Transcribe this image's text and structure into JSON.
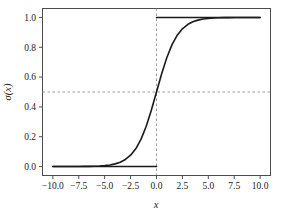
{
  "chart_data": {
    "type": "line",
    "title": "",
    "subtitle": "",
    "xlabel": "x",
    "ylabel": "σ(x)",
    "xlim": [
      -11.0,
      11.0
    ],
    "ylim": [
      -0.06,
      1.06
    ],
    "grid": false,
    "legend": null,
    "x_ticks": [
      -10.0,
      -7.5,
      -5.0,
      -2.5,
      0.0,
      2.5,
      5.0,
      7.5,
      10.0
    ],
    "x_tick_labels": [
      "−10.0",
      "−7.5",
      "−5.0",
      "−2.5",
      "0.0",
      "2.5",
      "5.0",
      "7.5",
      "10.0"
    ],
    "y_ticks": [
      0.0,
      0.2,
      0.4,
      0.6,
      0.8,
      1.0
    ],
    "y_tick_labels": [
      "0.0",
      "0.2",
      "0.4",
      "0.6",
      "0.8",
      "1.0"
    ],
    "series": [
      {
        "name": "sigmoid",
        "type": "line",
        "color": "#1a1a1a",
        "linewidth": 1.6,
        "x": [
          -10.0,
          -9.5,
          -9.0,
          -8.5,
          -8.0,
          -7.5,
          -7.0,
          -6.5,
          -6.0,
          -5.5,
          -5.0,
          -4.5,
          -4.0,
          -3.5,
          -3.0,
          -2.5,
          -2.0,
          -1.5,
          -1.0,
          -0.5,
          0.0,
          0.5,
          1.0,
          1.5,
          2.0,
          2.5,
          3.0,
          3.5,
          4.0,
          4.5,
          5.0,
          5.5,
          6.0,
          6.5,
          7.0,
          7.5,
          8.0,
          8.5,
          9.0,
          9.5,
          10.0
        ],
        "y": [
          4.54e-05,
          7.49e-05,
          0.0001234,
          0.0002035,
          0.0003354,
          0.0005527,
          0.0009111,
          0.0015012,
          0.0024726,
          0.0040702,
          0.0066929,
          0.0109869,
          0.0179862,
          0.0293122,
          0.0474259,
          0.0758582,
          0.1192029,
          0.1824255,
          0.2689414,
          0.3775407,
          0.5,
          0.6224593,
          0.7310586,
          0.8175745,
          0.8807971,
          0.9241418,
          0.9525741,
          0.9706878,
          0.9820138,
          0.9890131,
          0.9933071,
          0.9959298,
          0.9975274,
          0.9984988,
          0.9990889,
          0.9994473,
          0.9996646,
          0.9997965,
          0.9998766,
          0.9999251,
          0.9999546
        ]
      },
      {
        "name": "lower-asymptote",
        "type": "segment",
        "color": "#1a1a1a",
        "linewidth": 1.6,
        "x": [
          -10.0,
          0.0
        ],
        "y": [
          0.0,
          0.0
        ]
      },
      {
        "name": "upper-asymptote",
        "type": "segment",
        "color": "#1a1a1a",
        "linewidth": 1.6,
        "x": [
          0.0,
          10.0
        ],
        "y": [
          1.0,
          1.0
        ]
      }
    ],
    "reference_lines": [
      {
        "name": "vertical-threshold",
        "orientation": "vertical",
        "value": 0.0,
        "style": "dashed",
        "color": "#9a9a9a"
      },
      {
        "name": "horizontal-threshold",
        "orientation": "horizontal",
        "value": 0.5,
        "style": "dashed",
        "color": "#9a9a9a"
      }
    ],
    "annotations": [],
    "colors": {
      "curve": "#1a1a1a",
      "reference": "#9a9a9a",
      "frame": "#4d4d4d",
      "background": "#ffffff",
      "text": "#1a1a1a"
    }
  }
}
